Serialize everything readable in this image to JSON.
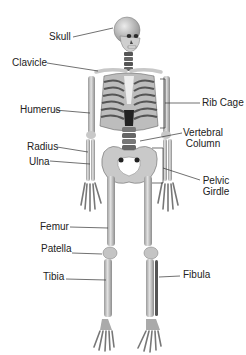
{
  "diagram": {
    "colors": {
      "background": "#ffffff",
      "bone": "#d6d6d6",
      "bone_shade": "#8a8a8a",
      "bone_dark": "#3a3a3a",
      "label_text": "#222222",
      "leader_line": "#333333"
    },
    "labels": {
      "skull": "Skull",
      "clavicle": "Clavicle",
      "humerus": "Humerus",
      "rib_cage": "Rib Cage",
      "vertebral_line1": "Vertebral",
      "vertebral_line2": "Column",
      "radius": "Radius",
      "ulna": "Ulna",
      "pelvic_line1": "Pelvic",
      "pelvic_line2": "Girdle",
      "femur": "Femur",
      "patella": "Patella",
      "tibia": "Tibia",
      "fibula": "Fibula"
    }
  }
}
